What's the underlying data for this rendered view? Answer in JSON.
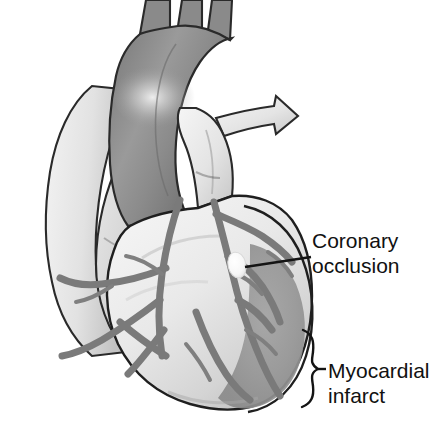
{
  "figure": {
    "kind": "medical-illustration",
    "background_color": "#ffffff",
    "outline_color": "#1a1a1a"
  },
  "palette": {
    "aorta_gray": "#8a8a8a",
    "aorta_dark": "#6f6f6f",
    "aorta_highlight": "#e8e8e8",
    "vessel_light": "#e2e2e2",
    "vessel_light_shadow": "#c9c9c9",
    "ventricle_light": "#efefef",
    "ventricle_mid": "#d2d2d2",
    "atrium_gray": "#b9b9b9",
    "coronary_gray": "#7d7d7d",
    "coronary_dark": "#636363",
    "infarct_gray": "#9a9a9a",
    "infarct_dark": "#8b8b8b",
    "occlusion_white": "#fbfbfb",
    "leader_black": "#141414",
    "text_black": "#111111"
  },
  "labels": {
    "coronary": {
      "line1": "Coronary",
      "line2": "occlusion",
      "marker": "occlusion-marker",
      "leader": "straight-leader-line"
    },
    "infarct": {
      "line1": "Myocardial",
      "line2": "infarct",
      "leader": "curly-brace"
    }
  },
  "anatomy": [
    {
      "name": "brachiocephalic-trunk",
      "group": "great-vessels"
    },
    {
      "name": "left-common-carotid-artery",
      "group": "great-vessels"
    },
    {
      "name": "left-subclavian-artery",
      "group": "great-vessels"
    },
    {
      "name": "aortic-arch",
      "group": "great-vessels"
    },
    {
      "name": "ascending-aorta",
      "group": "great-vessels"
    },
    {
      "name": "pulmonary-trunk",
      "group": "great-vessels"
    },
    {
      "name": "right-pulmonary-artery",
      "group": "great-vessels"
    },
    {
      "name": "superior-vena-cava",
      "group": "great-vessels"
    },
    {
      "name": "right-atrium",
      "group": "chambers"
    },
    {
      "name": "right-ventricle",
      "group": "chambers"
    },
    {
      "name": "left-ventricle",
      "group": "chambers"
    },
    {
      "name": "left-anterior-descending-artery",
      "group": "coronary"
    },
    {
      "name": "right-coronary-artery",
      "group": "coronary"
    },
    {
      "name": "diagonal-branches",
      "group": "coronary"
    },
    {
      "name": "marginal-branches",
      "group": "coronary"
    },
    {
      "name": "coronary-occlusion-site",
      "group": "pathology"
    },
    {
      "name": "myocardial-infarct-zone",
      "group": "pathology"
    }
  ]
}
